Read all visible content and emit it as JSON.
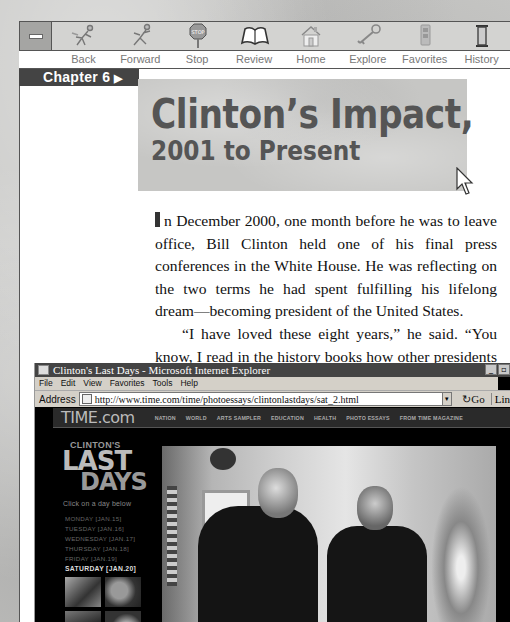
{
  "toolbar": {
    "minimize_label": "",
    "buttons": [
      {
        "id": "back",
        "label": "Back",
        "icon": "running-figure-left-icon"
      },
      {
        "id": "forward",
        "label": "Forward",
        "icon": "running-figure-right-icon"
      },
      {
        "id": "stop",
        "label": "Stop",
        "icon": "stop-sign-icon"
      },
      {
        "id": "review",
        "label": "Review",
        "icon": "open-book-icon"
      },
      {
        "id": "home",
        "label": "Home",
        "icon": "house-icon"
      },
      {
        "id": "explore",
        "label": "Explore",
        "icon": "key-icon"
      },
      {
        "id": "favorites",
        "label": "Favorites",
        "icon": "bookmark-icon"
      },
      {
        "id": "history",
        "label": "History",
        "icon": "hourglass-icon"
      }
    ]
  },
  "chapter": {
    "label": "Chapter 6",
    "arrow": "▶"
  },
  "title": {
    "line1": "Clinton’s Impact,",
    "line2": "2001 to Present"
  },
  "body": {
    "paragraph1": "n December 2000, one month before he was to leave office, Bill Clinton held one of his final press conferences in the White House. He was reflecting on the two terms he had spent fulfilling his lifelong dream—becoming president of the United States.",
    "dropcap": "I",
    "paragraph2": "“I have loved these eight years,” he said. “You know, I read in the history books how other presidents say the"
  },
  "browser": {
    "window_title": "Clinton's Last Days - Microsoft Internet Explorer",
    "window_buttons": [
      "_",
      "▫"
    ],
    "menu": [
      "File",
      "Edit",
      "View",
      "Favorites",
      "Tools",
      "Help"
    ],
    "address_label": "Address",
    "url": "http://www.time.com/time/photoessays/clintonlastdays/sat_2.html",
    "go_label": "Go",
    "links_label": "Lin",
    "site": {
      "logo": "TIME.com",
      "nav": [
        "NATION",
        "WORLD",
        "ARTS SAMPLER",
        "EDUCATION",
        "HEALTH",
        "PHOTO ESSAYS",
        "FROM TIME MAGAZINE"
      ],
      "feature_small": "CLINTON'S",
      "feature_last": "LAST",
      "feature_days": "DAYS",
      "prompt": "Click on a day below",
      "days": [
        {
          "label": "MONDAY [JAN.15]",
          "active": false
        },
        {
          "label": "TUESDAY [JAN.16]",
          "active": false
        },
        {
          "label": "WEDNESDAY [JAN.17]",
          "active": false
        },
        {
          "label": "THURSDAY [JAN.18]",
          "active": false
        },
        {
          "label": "FRIDAY [JAN.19]",
          "active": false
        },
        {
          "label": "SATURDAY [JAN.20]",
          "active": true
        }
      ]
    }
  },
  "colors": {
    "chapter_tab": "#444444",
    "title_text": "#555555",
    "background_texture": "#c9c9c7",
    "ie_titlebar": "#444444",
    "site_bg": "#000000"
  }
}
